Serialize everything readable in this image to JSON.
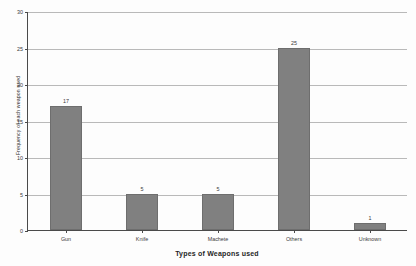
{
  "chart_data": {
    "type": "bar",
    "title": "",
    "xlabel": "Types of Weapons used",
    "ylabel": "Frequency of each weapon used",
    "categories": [
      "Gun",
      "Knife",
      "Machete",
      "Others",
      "Unknown"
    ],
    "values": [
      17,
      5,
      5,
      25,
      1
    ],
    "value_labels": [
      "17",
      "5",
      "5",
      "25",
      "1"
    ],
    "ylim": [
      0,
      30
    ],
    "yticks": [
      0,
      5,
      10,
      15,
      20,
      25,
      30
    ],
    "ytick_labels": [
      "0",
      "5",
      "10",
      "15",
      "20",
      "25",
      "30"
    ],
    "grid": "horizontal",
    "legend": "none",
    "bar_color": "#808080",
    "gridline_color": "#b9b9b9",
    "axis_color": "#4a4a4a"
  }
}
